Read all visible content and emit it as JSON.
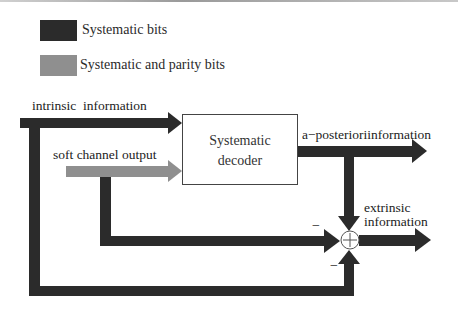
{
  "colors": {
    "systematic": "#2b2b2b",
    "systematic_parity": "#8f8f8f",
    "background": "#ffffff"
  },
  "legend": {
    "items": [
      {
        "label": "Systematic bits",
        "color": "#2b2b2b"
      },
      {
        "label": "Systematic and parity bits",
        "color": "#8f8f8f"
      }
    ]
  },
  "diagram": {
    "decoder": {
      "line1": "Systematic",
      "line2": "decoder"
    },
    "inputs": {
      "intrinsic": "intrinsic  information",
      "soft_channel": "soft channel output"
    },
    "outputs": {
      "a_posteriori": "a−posterioriinformation",
      "extrinsic_line1": "extrinsic",
      "extrinsic_line2": "information"
    },
    "summing_junction": {
      "symbol": "+",
      "sign_left": "−",
      "sign_bottom": "−"
    }
  }
}
